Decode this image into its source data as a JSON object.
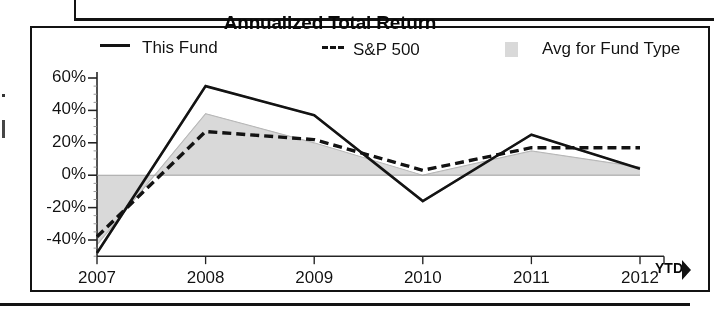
{
  "chart_data": {
    "type": "line",
    "title": "Annualized Total Return",
    "xlabel": "",
    "ylabel": "",
    "x": [
      "2007",
      "2008",
      "2009",
      "2010",
      "2011",
      "2012"
    ],
    "x_suffix_label": "YTD",
    "ylim": [
      -50,
      60
    ],
    "ytick_labels": [
      "60%",
      "40%",
      "20%",
      "0%",
      "-20%",
      "-40%"
    ],
    "ytick_values": [
      60,
      40,
      20,
      0,
      -20,
      -40
    ],
    "grid": false,
    "legend_position": "top",
    "series": [
      {
        "name": "This Fund",
        "style": "solid-line",
        "color": "#1b1b1b",
        "values": [
          -48,
          55,
          37,
          -16,
          25,
          4
        ]
      },
      {
        "name": "S&P 500",
        "style": "dashed-line",
        "color": "#1b1b1b",
        "values": [
          -38,
          27,
          22,
          3,
          17,
          17
        ]
      },
      {
        "name": "Avg for Fund Type",
        "style": "filled-area",
        "color": "#d2d2d2",
        "values": [
          -43,
          38,
          20,
          0,
          15,
          5
        ]
      }
    ]
  },
  "title": {
    "text": "Annualized Total Return"
  },
  "legend": {
    "items": [
      {
        "label": "This Fund",
        "marker": "solid-line-swatch"
      },
      {
        "label": "S&P 500",
        "marker": "dashed-line-swatch"
      },
      {
        "label": "Avg for Fund Type",
        "marker": "gray-box-swatch"
      }
    ]
  },
  "axes": {
    "y_ticks": [
      {
        "label": "60%"
      },
      {
        "label": "40%"
      },
      {
        "label": "20%"
      },
      {
        "label": "0%"
      },
      {
        "label": "-20%"
      },
      {
        "label": "-40%"
      }
    ],
    "x_ticks": [
      {
        "label": "2007"
      },
      {
        "label": "2008"
      },
      {
        "label": "2009"
      },
      {
        "label": "2010"
      },
      {
        "label": "2011"
      },
      {
        "label": "2012"
      }
    ],
    "x_ytd": "YTD"
  }
}
